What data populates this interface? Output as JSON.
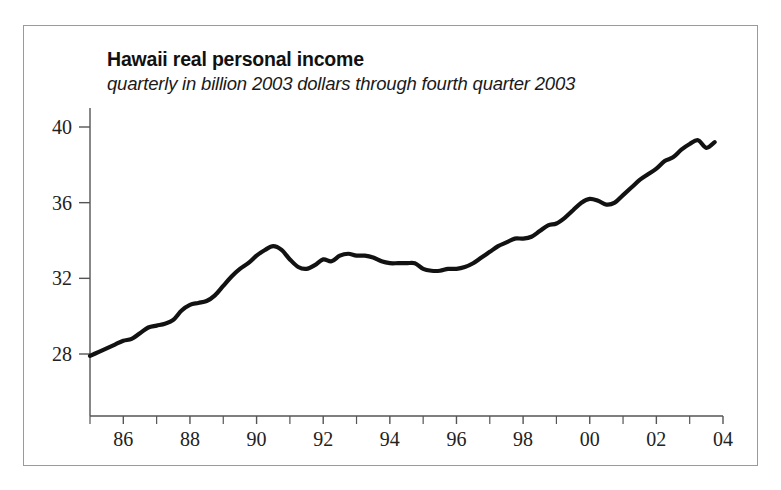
{
  "figure": {
    "title": "Hawaii real personal income",
    "subtitle": "quarterly in billion 2003 dollars through fourth quarter 2003",
    "border_color": "#9a9a9a",
    "line_color": "#121212",
    "background": "#ffffff"
  },
  "chart_data": {
    "type": "line",
    "title": "Hawaii real personal income",
    "subtitle": "quarterly in billion 2003 dollars through fourth quarter 2003",
    "xlabel": "",
    "ylabel": "",
    "xlim": [
      1985.0,
      2004.0
    ],
    "ylim": [
      26.0,
      41.2
    ],
    "grid": false,
    "legend": null,
    "y_ticks": [
      28,
      32,
      36,
      40
    ],
    "y_tick_labels": [
      "28",
      "32",
      "36",
      "40"
    ],
    "x_ticks": [
      1986,
      1988,
      1990,
      1992,
      1994,
      1996,
      1998,
      2000,
      2002,
      2004
    ],
    "x_tick_labels": [
      "86",
      "88",
      "90",
      "92",
      "94",
      "96",
      "98",
      "00",
      "02",
      "04"
    ],
    "x_minor_ticks": [
      1985,
      1987,
      1989,
      1991,
      1993,
      1995,
      1997,
      1999,
      2001,
      2003
    ],
    "series": [
      {
        "name": "Hawaii real personal income",
        "units": "billion 2003 dollars",
        "frequency": "quarterly",
        "x": [
          1985.0,
          1985.25,
          1985.5,
          1985.75,
          1986.0,
          1986.25,
          1986.5,
          1986.75,
          1987.0,
          1987.25,
          1987.5,
          1987.75,
          1988.0,
          1988.25,
          1988.5,
          1988.75,
          1989.0,
          1989.25,
          1989.5,
          1989.75,
          1990.0,
          1990.25,
          1990.5,
          1990.75,
          1991.0,
          1991.25,
          1991.5,
          1991.75,
          1992.0,
          1992.25,
          1992.5,
          1992.75,
          1993.0,
          1993.25,
          1993.5,
          1993.75,
          1994.0,
          1994.25,
          1994.5,
          1994.75,
          1995.0,
          1995.25,
          1995.5,
          1995.75,
          1996.0,
          1996.25,
          1996.5,
          1996.75,
          1997.0,
          1997.25,
          1997.5,
          1997.75,
          1998.0,
          1998.25,
          1998.5,
          1998.75,
          1999.0,
          1999.25,
          1999.5,
          1999.75,
          2000.0,
          2000.25,
          2000.5,
          2000.75,
          2001.0,
          2001.25,
          2001.5,
          2001.75,
          2002.0,
          2002.25,
          2002.5,
          2002.75,
          2003.0,
          2003.25,
          2003.5,
          2003.75
        ],
        "values": [
          27.9,
          28.1,
          28.3,
          28.5,
          28.7,
          28.8,
          29.1,
          29.4,
          29.5,
          29.6,
          29.8,
          30.3,
          30.6,
          30.7,
          30.8,
          31.1,
          31.6,
          32.1,
          32.5,
          32.8,
          33.2,
          33.5,
          33.7,
          33.5,
          33.0,
          32.6,
          32.5,
          32.7,
          33.0,
          32.9,
          33.2,
          33.3,
          33.2,
          33.2,
          33.1,
          32.9,
          32.8,
          32.8,
          32.8,
          32.8,
          32.5,
          32.4,
          32.4,
          32.5,
          32.5,
          32.6,
          32.8,
          33.1,
          33.4,
          33.7,
          33.9,
          34.1,
          34.1,
          34.2,
          34.5,
          34.8,
          34.9,
          35.2,
          35.6,
          36.0,
          36.2,
          36.1,
          35.9,
          36.0,
          36.4,
          36.8,
          37.2,
          37.5,
          37.8,
          38.2,
          38.4,
          38.8,
          39.1,
          39.3,
          38.9,
          39.2
        ]
      }
    ]
  }
}
